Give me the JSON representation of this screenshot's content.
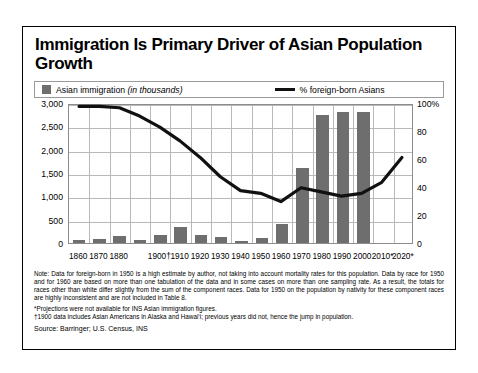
{
  "title": "Immigration Is Primary Driver of Asian Population Growth",
  "legend": {
    "bar_label": "Asian immigration",
    "bar_label_italic": "(in thousands)",
    "line_label": "% foreign-born Asians",
    "bar_color": "#6e6e6e",
    "line_color": "#111111"
  },
  "notes": {
    "line1": "Note: Data for foreign-born in 1950 is a high estimate by author, not taking into account mortality rates for this population. Data by race for 1950 and for 1960 are based on more than one tabulation of the data and in some cases on more than one sampling rate. As a result, the totals for races other than white differ slightly from the sum of the component races. Data for 1950 on the population by nativity for these component races are highly inconsistent and are not included in Table 8.",
    "line2": "*Projections were not available for INS Asian immigration figures.",
    "line3": "†1900 data includes Asian Americans in Alaska and Hawai‘i; previous years did not, hence the jump in population.",
    "source": "Source: Barringer; U.S. Census, INS"
  },
  "chart_data": {
    "type": "bar",
    "title": "Immigration Is Primary Driver of Asian Population Growth",
    "xlabel": "",
    "ylabel": "Asian immigration (in thousands)",
    "y2label": "% foreign-born Asians",
    "ylim": [
      0,
      3000
    ],
    "y2lim": [
      0,
      100
    ],
    "grid": true,
    "legend_position": "top",
    "categories": [
      "1860",
      "1870",
      "1880",
      "1890",
      "1900†",
      "1910",
      "1920",
      "1930",
      "1940",
      "1950",
      "1960",
      "1970",
      "1980",
      "1990",
      "2000",
      "2010*",
      "2020*"
    ],
    "xtick_labels": [
      "1860",
      "1870",
      "1880",
      "",
      "1900†",
      "1910",
      "1920",
      "1930",
      "1940",
      "1950",
      "1960",
      "1970",
      "1980",
      "1990",
      "2000",
      "2010*",
      "2020*"
    ],
    "yticks": [
      0,
      500,
      1000,
      1500,
      2000,
      2500,
      3000
    ],
    "ytick_labels": [
      "0",
      "500",
      "1,000",
      "1,500",
      "2,000",
      "2,500",
      "3,000"
    ],
    "y2ticks": [
      0,
      20,
      40,
      60,
      80,
      100
    ],
    "y2tick_labels": [
      "0",
      "20",
      "40",
      "60",
      "80",
      "100%"
    ],
    "series": [
      {
        "name": "Asian immigration (in thousands)",
        "type": "bar",
        "axis": "left",
        "values": [
          60,
          95,
          160,
          70,
          180,
          340,
          165,
          130,
          40,
          100,
          400,
          1600,
          2750,
          2800,
          2800,
          null,
          null
        ]
      },
      {
        "name": "% foreign-born Asians",
        "type": "line",
        "axis": "right",
        "values": [
          99,
          99,
          98,
          92,
          84,
          74,
          62,
          48,
          38,
          36,
          30,
          40,
          37,
          34,
          36,
          44,
          62
        ]
      }
    ]
  }
}
